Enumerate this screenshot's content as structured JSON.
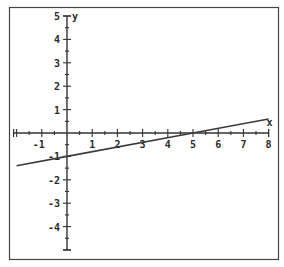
{
  "chart_data": {
    "type": "line",
    "title": "",
    "xlabel": "x",
    "ylabel": "y",
    "xlim": [
      -2,
      8
    ],
    "ylim": [
      -5,
      5
    ],
    "grid": false,
    "legend": null,
    "x_ticks": [
      -1,
      1,
      2,
      3,
      4,
      5,
      6,
      7,
      8
    ],
    "y_ticks": [
      5,
      4,
      3,
      2,
      1,
      -1,
      -2,
      -3,
      -4
    ],
    "minor_ticks_per_unit": 2,
    "series": [
      {
        "name": "y = 0.2x - 1",
        "equation": "y = 0.2x - 1",
        "x": [
          -2,
          0,
          5,
          8
        ],
        "y": [
          -1.4,
          -1,
          0,
          0.6
        ]
      }
    ],
    "annotations": {
      "x_intercept": 5,
      "y_intercept": -1
    },
    "colors": {
      "axis": "#333333",
      "line": "#3a3a3a",
      "frame": "#444444",
      "background": "#ffffff"
    }
  }
}
